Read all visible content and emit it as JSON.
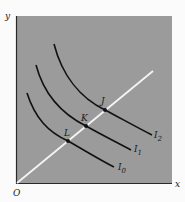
{
  "diagram": {
    "type": "indifference-curve-map",
    "axes": {
      "y_label": "y",
      "x_label": "x",
      "origin_label": "O"
    },
    "ray": {
      "description": "straight line from origin through tangency/intersection points",
      "color": "#f2f2f2"
    },
    "curves": [
      {
        "id": "I0",
        "label": "I",
        "subscript": "0",
        "point_label": "L"
      },
      {
        "id": "I1",
        "label": "I",
        "subscript": "1",
        "point_label": "K"
      },
      {
        "id": "I2",
        "label": "I",
        "subscript": "2",
        "point_label": "J"
      }
    ],
    "colors": {
      "panel": "#9a9a9a",
      "curve": "#111111",
      "background": "#fbfbfb"
    }
  }
}
